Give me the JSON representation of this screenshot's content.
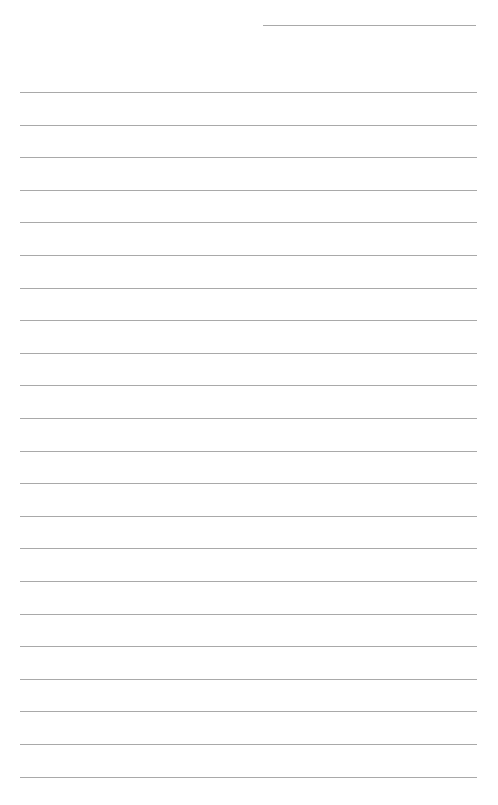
{
  "page": {
    "type": "lined-paper",
    "background_color": "#ffffff",
    "line_color": "#a9a9a9",
    "header_line": {
      "present": true,
      "label": ""
    },
    "ruled_line_count": 22,
    "text_content": ""
  }
}
